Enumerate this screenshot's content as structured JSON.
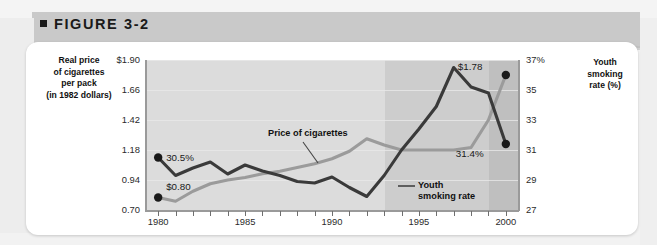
{
  "figure": {
    "bullet": "■",
    "label": "FIGURE 3-2"
  },
  "axis_titles": {
    "left": "Real price\nof cigarettes\nper pack\n(in 1982 dollars)",
    "right": "Youth\nsmoking\nrate (%)"
  },
  "annotations": {
    "price_series_label": "Price of cigarettes",
    "youth_series_label": "Youth\nsmoking rate",
    "price_start": "$0.80",
    "price_end": "$1.78",
    "youth_start": "30.5%",
    "youth_end": "31.4%"
  },
  "colors": {
    "youth_series": "#3a3a3a",
    "price_series": "#9b9b9b",
    "plot_band_1": "#dcdcdc",
    "plot_band_2": "#cdcdcd",
    "plot_band_3": "#bfbfbf",
    "card": "#ffffff",
    "header_band": "#c9c9c9"
  },
  "chart_data": {
    "type": "line",
    "title": "FIGURE 3-2",
    "xlabel": "",
    "ylabel": "Real price of cigarettes per pack (in 1982 dollars)",
    "y2label": "Youth smoking rate (%)",
    "xlim": [
      1979.3,
      2000.7
    ],
    "ylim": [
      0.7,
      1.9
    ],
    "y2lim": [
      27,
      37
    ],
    "yticks": [
      0.7,
      0.94,
      1.18,
      1.42,
      1.66,
      1.9
    ],
    "ytick_labels": [
      "0.70",
      "0.94",
      "1.18",
      "1.42",
      "1.66",
      "$1.90"
    ],
    "y2ticks": [
      27,
      29,
      31,
      33,
      35,
      37
    ],
    "y2tick_labels": [
      "27",
      "29",
      "31",
      "33",
      "35",
      "37%"
    ],
    "xticks": [
      1980,
      1985,
      1990,
      1995,
      2000
    ],
    "xtick_labels": [
      "1980",
      "1985",
      "1990",
      "1995",
      "2000"
    ],
    "minor_xticks": [
      1981,
      1982,
      1983,
      1984,
      1986,
      1987,
      1988,
      1989,
      1991,
      1992,
      1993,
      1994,
      1996,
      1997,
      1998,
      1999
    ],
    "grid": true,
    "legend": "inline-labels",
    "shaded_bands": [
      {
        "from": 1979.3,
        "to": 1992.0,
        "shade": "light"
      },
      {
        "from": 1992.0,
        "to": 1997.0,
        "shade": "medium"
      },
      {
        "from": 1997.0,
        "to": 2000.7,
        "shade": "dark"
      }
    ],
    "x": [
      1980,
      1981,
      1982,
      1983,
      1984,
      1985,
      1986,
      1987,
      1988,
      1989,
      1990,
      1991,
      1992,
      1993,
      1994,
      1995,
      1996,
      1997,
      1998,
      1999,
      2000
    ],
    "series": [
      {
        "name": "Price of cigarettes",
        "axis": "left",
        "units": "1982 dollars per pack",
        "values": [
          0.8,
          0.77,
          0.85,
          0.91,
          0.94,
          0.96,
          0.99,
          1.01,
          1.04,
          1.07,
          1.11,
          1.17,
          1.27,
          1.22,
          1.18,
          1.18,
          1.18,
          1.18,
          1.2,
          1.42,
          1.78
        ],
        "endpoint_labels": {
          "1980": "$0.80",
          "2000": "$1.78"
        }
      },
      {
        "name": "Youth smoking rate",
        "axis": "right",
        "units": "percent",
        "values": [
          30.5,
          29.3,
          29.8,
          30.2,
          29.4,
          30.0,
          29.6,
          29.3,
          28.9,
          28.8,
          29.2,
          28.5,
          27.9,
          29.3,
          31.0,
          32.4,
          33.9,
          36.5,
          35.2,
          34.8,
          31.4
        ],
        "endpoint_labels": {
          "1980": "30.5%",
          "2000": "31.4%"
        }
      }
    ]
  }
}
